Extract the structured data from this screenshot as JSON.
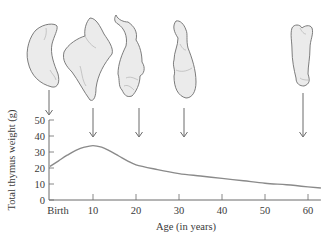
{
  "chart_data": {
    "type": "line",
    "title": "",
    "xlabel": "Age (in years)",
    "ylabel": "Total thymus weight (g)",
    "xlim": [
      0,
      63
    ],
    "ylim": [
      0,
      50
    ],
    "x_ticks": [
      0,
      10,
      20,
      30,
      40,
      50,
      60
    ],
    "x_tick_labels": [
      "Birth",
      "10",
      "20",
      "30",
      "40",
      "50",
      "60"
    ],
    "y_ticks": [
      0,
      10,
      20,
      30,
      40,
      50
    ],
    "y_tick_labels": [
      "0",
      "10",
      "20",
      "30",
      "40",
      "50"
    ],
    "grid": false,
    "legend": null,
    "series": [
      {
        "name": "Total thymus weight",
        "x": [
          0,
          2,
          4,
          6,
          8,
          10,
          12,
          14,
          16,
          18,
          20,
          25,
          30,
          35,
          40,
          45,
          50,
          55,
          60,
          63
        ],
        "values": [
          21,
          24.5,
          28,
          31,
          33,
          34,
          33,
          30.5,
          27.5,
          24.5,
          22,
          19,
          16.5,
          15,
          13.5,
          12,
          10.5,
          9.5,
          8.2,
          7.5
        ]
      }
    ],
    "annotations": [
      {
        "type": "thymus-illustration-with-arrow",
        "age": 0
      },
      {
        "type": "thymus-illustration-with-arrow",
        "age": 10
      },
      {
        "type": "thymus-illustration-with-arrow",
        "age": 20
      },
      {
        "type": "thymus-illustration-with-arrow",
        "age": 30
      },
      {
        "type": "thymus-illustration-with-arrow",
        "age": 58
      }
    ],
    "colors": {
      "line": "#8a8a8a",
      "axis": "#6a6a6a",
      "organ_fill": "#ebebeb",
      "organ_stroke": "#6e6e6e"
    }
  }
}
